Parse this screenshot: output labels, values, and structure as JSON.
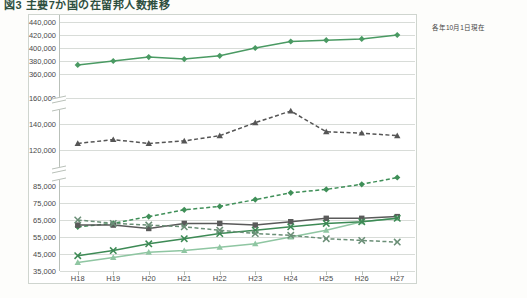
{
  "title": "図3 主要7か国の在留邦人数推移",
  "legend_note": "各年10月1日現在",
  "axis": {
    "x_labels": [
      "H18",
      "H19",
      "H20",
      "H21",
      "H22",
      "H23",
      "H24",
      "H25",
      "H26",
      "H27"
    ],
    "y_ticks_top": [
      "440,000",
      "420,000",
      "400,000",
      "380,000",
      "360,000"
    ],
    "y_ticks_mid": [
      "160,000",
      "140,000",
      "120,000"
    ],
    "y_ticks_bottom": [
      "85,000",
      "75,000",
      "65,000",
      "55,000",
      "45,000",
      "35,000"
    ],
    "broken": true
  },
  "colors": {
    "beikoku": "#4a9a63",
    "chugoku": "#555555",
    "australia": "#3f8f58",
    "eikoku": "#5a5a5a",
    "thai": "#8fc6a2",
    "canada": "#3d8a55",
    "brazil": "#6b8f77",
    "grid": "#d8dcd8",
    "frame": "#cfd5cf"
  },
  "chart_data": {
    "type": "line",
    "title": "図3 主要7か国の在留邦人数推移",
    "xlabel": "",
    "ylabel": "",
    "x": [
      "H18",
      "H19",
      "H20",
      "H21",
      "H22",
      "H23",
      "H24",
      "H25",
      "H26",
      "H27"
    ],
    "broken_axis": true,
    "panels": [
      {
        "name": "top",
        "ylim": [
          360000,
          440000
        ],
        "ticks": [
          360000,
          380000,
          400000,
          420000,
          440000
        ]
      },
      {
        "name": "middle",
        "ylim": [
          120000,
          160000
        ],
        "ticks": [
          120000,
          140000,
          160000
        ]
      },
      {
        "name": "bottom",
        "ylim": [
          35000,
          85000
        ],
        "ticks": [
          35000,
          45000,
          55000,
          65000,
          75000,
          85000
        ]
      }
    ],
    "series": [
      {
        "name": "米国",
        "panel": "top",
        "style": "solid",
        "marker": "diamond",
        "color": "#4a9a63",
        "values": [
          374000,
          380000,
          386000,
          383000,
          388000,
          400000,
          410000,
          412000,
          414000,
          420000
        ]
      },
      {
        "name": "中国",
        "panel": "middle",
        "style": "dashed",
        "marker": "triangle",
        "color": "#555555",
        "values": [
          125000,
          128000,
          125000,
          127000,
          131000,
          141000,
          150000,
          134000,
          133000,
          131000
        ]
      },
      {
        "name": "オーストラリア",
        "panel": "bottom",
        "style": "dashed",
        "marker": "diamond",
        "color": "#3f8f58",
        "values": [
          61000,
          63000,
          67000,
          71000,
          73000,
          77000,
          81000,
          83000,
          86000,
          90000
        ]
      },
      {
        "name": "英国",
        "panel": "bottom",
        "style": "solid",
        "marker": "square",
        "color": "#5a5a5a",
        "values": [
          62000,
          62000,
          60000,
          63000,
          63000,
          62000,
          64000,
          66000,
          66000,
          67000
        ]
      },
      {
        "name": "タイ",
        "panel": "bottom",
        "style": "solid",
        "marker": "triangle",
        "color": "#8fc6a2",
        "values": [
          40000,
          43000,
          46000,
          47000,
          49000,
          51000,
          55000,
          59000,
          64000,
          66000
        ]
      },
      {
        "name": "カナダ",
        "panel": "bottom",
        "style": "solid",
        "marker": "cross",
        "color": "#3d8a55",
        "values": [
          44000,
          47000,
          51000,
          54000,
          57000,
          59000,
          61000,
          63000,
          64000,
          66000
        ]
      },
      {
        "name": "ブラジル",
        "panel": "bottom",
        "style": "dashed",
        "marker": "cross",
        "color": "#6b8f77",
        "values": [
          65000,
          63000,
          62000,
          61000,
          59000,
          57000,
          56000,
          54000,
          53000,
          52000
        ]
      }
    ],
    "legend_position": "right",
    "legend_entries": [
      "米国",
      "中国",
      "オースト\nラリア",
      "英国",
      "タイ",
      "カナダ",
      "ブラジル"
    ]
  }
}
